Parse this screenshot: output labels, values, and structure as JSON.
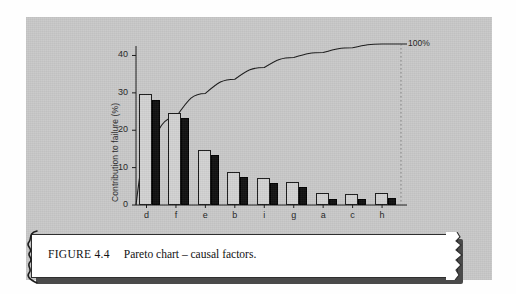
{
  "figure": {
    "caption_number": "FIGURE 4.4",
    "caption_text": "Pareto chart – causal factors.",
    "panel_color": "#c9c9c9",
    "plate_color": "#ffffff"
  },
  "chart_data": {
    "type": "bar",
    "title": "",
    "subtitle": "",
    "xlabel": "",
    "ylabel": "Contribution to failure (%)",
    "categories": [
      "d",
      "f",
      "e",
      "b",
      "i",
      "g",
      "a",
      "c",
      "h"
    ],
    "series": [
      {
        "name": "open",
        "style": "hollow",
        "values": [
          29.8,
          24.7,
          14.8,
          8.8,
          7.3,
          6.2,
          3.1,
          3.0,
          3.2
        ]
      },
      {
        "name": "solid",
        "style": "filled",
        "values": [
          28.2,
          23.3,
          13.4,
          7.4,
          5.8,
          4.8,
          1.7,
          1.7,
          1.8
        ]
      }
    ],
    "cumulative": {
      "label": "100%",
      "values": [
        29.8,
        54.5,
        69.3,
        78.1,
        85.4,
        91.6,
        94.7,
        97.7,
        100.0
      ],
      "end_label": "100%"
    },
    "ylim": [
      0,
      42
    ],
    "yticks": [
      0,
      10,
      20,
      30,
      40
    ],
    "ytick_labels": [
      "0",
      "10",
      "20",
      "30",
      "40"
    ],
    "grid": false,
    "legend": "none",
    "series_colors": {
      "open": "#d2d2d2",
      "open_border": "#1b1b1b",
      "solid": "#111111"
    }
  }
}
